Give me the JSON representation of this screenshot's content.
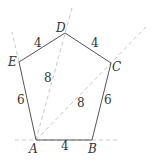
{
  "diagram": {
    "shape": "pentagon",
    "vertices": [
      {
        "name": "A",
        "x": 36,
        "y": 140
      },
      {
        "name": "B",
        "x": 92,
        "y": 140
      },
      {
        "name": "C",
        "x": 111,
        "y": 63
      },
      {
        "name": "D",
        "x": 65,
        "y": 33
      },
      {
        "name": "E",
        "x": 19,
        "y": 62
      }
    ],
    "vertex_labels": {
      "A": "A",
      "B": "B",
      "C": "C",
      "D": "D",
      "E": "E"
    },
    "side_labels": {
      "AB": "4",
      "BC": "6",
      "CD": "4",
      "DE": "4",
      "EA": "6"
    },
    "diagonal_labels": {
      "AD": "8",
      "AC": "8"
    },
    "colors": {
      "solid": "#555555",
      "dashed": "#c8c8c8",
      "text": "#333333"
    }
  }
}
